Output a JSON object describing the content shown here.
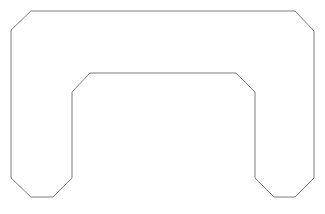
{
  "figure": {
    "background_color": "#ffffff",
    "stroke_color": "#6e6e70",
    "stroke_width": 0.9,
    "fill_color": "#ffffff",
    "width": 325,
    "height": 214,
    "shape_name": "chamfered-arch-outline",
    "path": "M 11 30 L 31 11 L 295 11 L 314 31 L 314 178 L 295 197 L 274 197 L 255 178 L 255 92 L 236 73 L 90 73 L 72 92 L 72 178 L 53 197 L 31 197 L 11 178 Z",
    "vertices": [
      {
        "name": "top-left-chamfer-lower",
        "x": 11,
        "y": 30
      },
      {
        "name": "top-left-chamfer-upper",
        "x": 31,
        "y": 11
      },
      {
        "name": "top-right-chamfer-upper",
        "x": 295,
        "y": 11
      },
      {
        "name": "top-right-chamfer-lower",
        "x": 314,
        "y": 31
      },
      {
        "name": "right-outer-bottom-start",
        "x": 314,
        "y": 178
      },
      {
        "name": "bottom-right-outer-corner",
        "x": 295,
        "y": 197
      },
      {
        "name": "bottom-right-inner-corner",
        "x": 274,
        "y": 197
      },
      {
        "name": "right-foot-inner-top",
        "x": 255,
        "y": 178
      },
      {
        "name": "right-notch-bottom",
        "x": 255,
        "y": 92
      },
      {
        "name": "right-notch-chamfer-top",
        "x": 236,
        "y": 73
      },
      {
        "name": "left-notch-chamfer-top",
        "x": 90,
        "y": 73
      },
      {
        "name": "left-notch-bottom",
        "x": 72,
        "y": 92
      },
      {
        "name": "left-foot-inner-top",
        "x": 72,
        "y": 178
      },
      {
        "name": "bottom-left-inner-corner",
        "x": 53,
        "y": 197
      },
      {
        "name": "bottom-left-outer-corner",
        "x": 31,
        "y": 197
      },
      {
        "name": "left-outer-bottom-start",
        "x": 11,
        "y": 178
      }
    ],
    "caption": ""
  }
}
